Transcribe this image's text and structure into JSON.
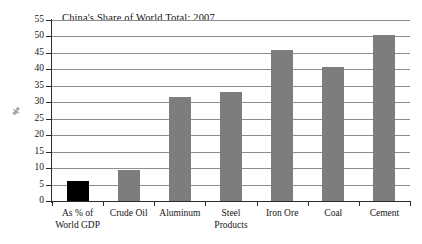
{
  "chart_data": {
    "type": "bar",
    "title": "China's Share of World Total: 2007",
    "xlabel": "",
    "ylabel": "%",
    "ylim": [
      0,
      55
    ],
    "ytick_step": 5,
    "yticks": [
      0,
      5,
      10,
      15,
      20,
      25,
      30,
      35,
      40,
      45,
      50,
      55
    ],
    "ytick_labels": [
      "0",
      "5",
      "10",
      "15",
      "20",
      "25",
      "30",
      "35",
      "40",
      "45",
      "50",
      "55"
    ],
    "grid": true,
    "grid_axis": "y",
    "legend": false,
    "categories": [
      "As % of\nWorld GDP",
      "Crude Oil",
      "Aluminum",
      "Steel\nProducts",
      "Iron Ore",
      "Coal",
      "Cement"
    ],
    "category_labels": [
      {
        "line1": "As % of",
        "line2": "World GDP"
      },
      {
        "line1": "Crude Oil",
        "line2": ""
      },
      {
        "line1": "Aluminum",
        "line2": ""
      },
      {
        "line1": "Steel",
        "line2": "Products"
      },
      {
        "line1": "Iron Ore",
        "line2": ""
      },
      {
        "line1": "Coal",
        "line2": ""
      },
      {
        "line1": "Cement",
        "line2": ""
      }
    ],
    "values": [
      6.0,
      9.3,
      31.5,
      33.0,
      45.8,
      40.7,
      50.5
    ],
    "bar_colors": [
      "#000000",
      "#7d7d7d",
      "#7d7d7d",
      "#7d7d7d",
      "#7d7d7d",
      "#7d7d7d",
      "#7d7d7d"
    ],
    "colors": {
      "highlight_bar": "#000000",
      "bar": "#7d7d7d",
      "gridline": "#8d8d8d",
      "axis": "#2b2b2b",
      "text": "#161616",
      "background": "#ffffff"
    }
  }
}
